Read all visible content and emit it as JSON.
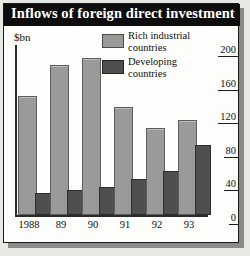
{
  "title": "Inflows of foreign direct investment",
  "units_label": "$bn",
  "legend": [
    {
      "label_line1": "Rich industrial",
      "label_line2": "countries",
      "swatch": "light",
      "color": "#9a9a9a"
    },
    {
      "label_line1": "Developing",
      "label_line2": "countries",
      "swatch": "dark",
      "color": "#4f4f4f"
    }
  ],
  "yticks": [
    "200",
    "160",
    "120",
    "80",
    "40",
    "0"
  ],
  "xlabels": [
    "1988",
    "89",
    "90",
    "91",
    "92",
    "93"
  ],
  "chart_data": {
    "type": "bar",
    "title": "Inflows of foreign direct investment",
    "xlabel": "",
    "ylabel": "$bn",
    "ylim": [
      0,
      200
    ],
    "yticks": [
      0,
      40,
      80,
      120,
      160,
      200
    ],
    "grid": false,
    "legend_position": "top-center",
    "categories": [
      "1988",
      "89",
      "90",
      "91",
      "92",
      "93"
    ],
    "series": [
      {
        "name": "Rich industrial countries",
        "color": "#9a9a9a",
        "values": [
          138,
          174,
          182,
          125,
          100,
          110
        ]
      },
      {
        "name": "Developing countries",
        "color": "#4f4f4f",
        "values": [
          24,
          27,
          31,
          40,
          50,
          80
        ]
      }
    ]
  }
}
